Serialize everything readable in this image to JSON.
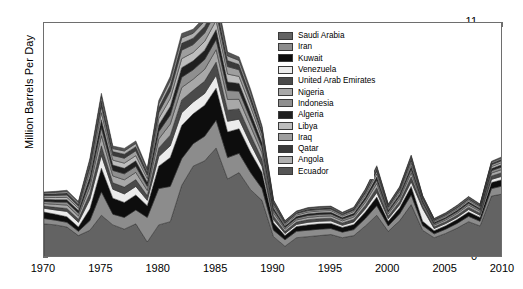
{
  "chart_data": {
    "type": "area",
    "stacked": true,
    "title": "",
    "subtitle": "",
    "xlabel": "",
    "ylabel": "Million Barrels Per Day",
    "xlim": [
      1970,
      2010
    ],
    "ylim": [
      0,
      11
    ],
    "ytick_labels": [
      "0",
      "1",
      "2",
      "3",
      "4",
      "5",
      "6",
      "7",
      "8",
      "9",
      "10",
      "11"
    ],
    "ytick_values": [
      0,
      1,
      2,
      3,
      4,
      5,
      6,
      7,
      8,
      9,
      10,
      11
    ],
    "xtick_labels": [
      "1970",
      "1975",
      "1980",
      "1985",
      "1990",
      "1995",
      "2000",
      "2005",
      "2010"
    ],
    "xtick_values": [
      1970,
      1975,
      1980,
      1985,
      1990,
      1995,
      2000,
      2005,
      2010
    ],
    "grid": false,
    "legend_position": "inside-top-center",
    "x": [
      1970,
      1971,
      1972,
      1973,
      1974,
      1975,
      1976,
      1977,
      1978,
      1979,
      1980,
      1981,
      1982,
      1983,
      1984,
      1985,
      1986,
      1987,
      1988,
      1989,
      1990,
      1991,
      1992,
      1993,
      1994,
      1995,
      1996,
      1997,
      1998,
      1999,
      2000,
      2001,
      2002,
      2003,
      2004,
      2005,
      2006,
      2007,
      2008,
      2009,
      2010
    ],
    "series": [
      {
        "name": "Saudi Arabia",
        "color": "#636363",
        "values": [
          1.6,
          1.55,
          1.45,
          1.05,
          1.3,
          2.0,
          1.55,
          1.35,
          1.6,
          0.75,
          1.55,
          1.7,
          3.4,
          4.3,
          4.55,
          5.15,
          3.7,
          4.0,
          3.2,
          2.7,
          1.0,
          0.55,
          0.95,
          1.0,
          1.05,
          1.1,
          0.95,
          1.05,
          1.5,
          2.0,
          1.25,
          1.75,
          2.5,
          1.3,
          0.95,
          1.15,
          1.4,
          1.7,
          1.5,
          2.9,
          3.0
        ]
      },
      {
        "name": "Iran",
        "color": "#8c8c8c",
        "values": [
          0.25,
          0.22,
          0.22,
          0.2,
          0.45,
          1.1,
          0.5,
          0.55,
          0.65,
          1.15,
          1.7,
          1.65,
          1.25,
          1.05,
          1.15,
          1.3,
          1.0,
          0.9,
          0.8,
          0.55,
          0.3,
          0.3,
          0.3,
          0.3,
          0.3,
          0.28,
          0.26,
          0.28,
          0.35,
          0.45,
          0.25,
          0.32,
          0.45,
          0.22,
          0.18,
          0.2,
          0.22,
          0.25,
          0.22,
          0.35,
          0.38
        ]
      },
      {
        "name": "Kuwait",
        "color": "#0d0d0d",
        "values": [
          0.3,
          0.28,
          0.26,
          0.2,
          0.55,
          1.1,
          0.75,
          0.7,
          0.7,
          0.55,
          1.05,
          1.35,
          1.55,
          1.4,
          1.45,
          1.5,
          1.2,
          1.15,
          0.95,
          0.75,
          0.35,
          0.2,
          0.22,
          0.25,
          0.25,
          0.24,
          0.22,
          0.24,
          0.3,
          0.4,
          0.22,
          0.28,
          0.4,
          0.2,
          0.15,
          0.16,
          0.18,
          0.2,
          0.18,
          0.28,
          0.3
        ]
      },
      {
        "name": "Venezuela",
        "color": "#ececec",
        "values": [
          0.18,
          0.2,
          0.25,
          0.22,
          0.45,
          0.6,
          0.42,
          0.4,
          0.4,
          0.25,
          0.45,
          0.55,
          0.6,
          0.55,
          0.55,
          0.6,
          0.5,
          0.45,
          0.4,
          0.3,
          0.15,
          0.1,
          0.1,
          0.12,
          0.12,
          0.12,
          0.1,
          0.12,
          0.15,
          0.22,
          0.12,
          0.15,
          0.22,
          0.6,
          0.1,
          0.1,
          0.1,
          0.12,
          0.1,
          0.15,
          0.16
        ]
      },
      {
        "name": "United Arab Emirates",
        "color": "#4a4a4a",
        "values": [
          0.1,
          0.12,
          0.14,
          0.14,
          0.28,
          0.45,
          0.3,
          0.32,
          0.32,
          0.22,
          0.4,
          0.5,
          0.6,
          0.55,
          0.58,
          0.62,
          0.52,
          0.48,
          0.42,
          0.32,
          0.16,
          0.1,
          0.11,
          0.12,
          0.12,
          0.12,
          0.11,
          0.12,
          0.16,
          0.22,
          0.12,
          0.15,
          0.22,
          0.11,
          0.08,
          0.09,
          0.1,
          0.11,
          0.1,
          0.16,
          0.17
        ]
      },
      {
        "name": "Nigeria",
        "color": "#a8a8a8",
        "values": [
          0.12,
          0.14,
          0.16,
          0.16,
          0.3,
          0.48,
          0.32,
          0.34,
          0.34,
          0.24,
          0.42,
          0.52,
          0.58,
          0.52,
          0.55,
          0.58,
          0.5,
          0.45,
          0.4,
          0.3,
          0.15,
          0.1,
          0.1,
          0.11,
          0.11,
          0.11,
          0.1,
          0.11,
          0.15,
          0.2,
          0.11,
          0.14,
          0.2,
          0.1,
          0.08,
          0.08,
          0.09,
          0.1,
          0.09,
          0.14,
          0.15
        ]
      },
      {
        "name": "Indonesia",
        "color": "#8f8f8f",
        "values": [
          0.1,
          0.11,
          0.13,
          0.13,
          0.25,
          0.38,
          0.26,
          0.28,
          0.28,
          0.2,
          0.34,
          0.42,
          0.48,
          0.44,
          0.46,
          0.48,
          0.42,
          0.38,
          0.33,
          0.25,
          0.12,
          0.08,
          0.08,
          0.09,
          0.09,
          0.09,
          0.08,
          0.09,
          0.12,
          0.16,
          0.09,
          0.11,
          0.16,
          0.08,
          0.06,
          0.07,
          0.07,
          0.08,
          0.07,
          0.11,
          0.12
        ]
      },
      {
        "name": "Algeria",
        "color": "#1f1f1f",
        "values": [
          0.1,
          0.11,
          0.12,
          0.12,
          0.24,
          0.36,
          0.25,
          0.26,
          0.26,
          0.19,
          0.32,
          0.4,
          0.45,
          0.42,
          0.44,
          0.46,
          0.4,
          0.36,
          0.31,
          0.23,
          0.11,
          0.07,
          0.08,
          0.08,
          0.08,
          0.08,
          0.07,
          0.08,
          0.11,
          0.15,
          0.08,
          0.1,
          0.15,
          0.07,
          0.06,
          0.06,
          0.07,
          0.07,
          0.06,
          0.1,
          0.11
        ]
      },
      {
        "name": "Libya",
        "color": "#bdbdbd",
        "values": [
          0.09,
          0.1,
          0.11,
          0.11,
          0.22,
          0.33,
          0.23,
          0.24,
          0.24,
          0.17,
          0.3,
          0.37,
          0.42,
          0.39,
          0.41,
          0.43,
          0.37,
          0.33,
          0.29,
          0.21,
          0.1,
          0.07,
          0.07,
          0.08,
          0.08,
          0.08,
          0.07,
          0.08,
          0.1,
          0.14,
          0.08,
          0.1,
          0.14,
          0.07,
          0.05,
          0.06,
          0.06,
          0.07,
          0.06,
          0.09,
          0.1
        ]
      },
      {
        "name": "Iraq",
        "color": "#9e9e9e",
        "values": [
          0.09,
          0.1,
          0.11,
          0.1,
          0.21,
          0.31,
          0.22,
          0.23,
          0.23,
          0.16,
          0.28,
          0.35,
          0.4,
          0.37,
          0.39,
          0.41,
          0.35,
          0.31,
          0.27,
          0.2,
          0.1,
          0.06,
          0.07,
          0.07,
          0.07,
          0.07,
          0.06,
          0.07,
          0.1,
          0.13,
          0.07,
          0.09,
          0.13,
          0.06,
          0.05,
          0.05,
          0.06,
          0.06,
          0.05,
          0.09,
          0.09
        ]
      },
      {
        "name": "Qatar",
        "color": "#3a3a3a",
        "values": [
          0.07,
          0.08,
          0.09,
          0.09,
          0.17,
          0.25,
          0.18,
          0.19,
          0.19,
          0.13,
          0.23,
          0.28,
          0.32,
          0.3,
          0.31,
          0.33,
          0.28,
          0.25,
          0.22,
          0.16,
          0.08,
          0.05,
          0.05,
          0.06,
          0.06,
          0.06,
          0.05,
          0.06,
          0.08,
          0.1,
          0.06,
          0.07,
          0.1,
          0.05,
          0.04,
          0.04,
          0.05,
          0.05,
          0.04,
          0.07,
          0.07
        ]
      },
      {
        "name": "Angola",
        "color": "#b0b0b0",
        "values": [
          0.05,
          0.06,
          0.07,
          0.07,
          0.13,
          0.19,
          0.14,
          0.15,
          0.15,
          0.1,
          0.18,
          0.22,
          0.25,
          0.23,
          0.24,
          0.25,
          0.22,
          0.19,
          0.17,
          0.12,
          0.06,
          0.04,
          0.04,
          0.04,
          0.04,
          0.04,
          0.04,
          0.04,
          0.06,
          0.08,
          0.04,
          0.05,
          0.08,
          0.04,
          0.03,
          0.03,
          0.04,
          0.04,
          0.03,
          0.05,
          0.06
        ]
      },
      {
        "name": "Ecuador",
        "color": "#555555",
        "values": [
          0.04,
          0.05,
          0.06,
          0.06,
          0.11,
          0.16,
          0.12,
          0.12,
          0.12,
          0.09,
          0.15,
          0.18,
          0.21,
          0.19,
          0.2,
          0.21,
          0.18,
          0.16,
          0.14,
          0.1,
          0.05,
          0.03,
          0.03,
          0.04,
          0.04,
          0.04,
          0.03,
          0.04,
          0.05,
          0.07,
          0.04,
          0.04,
          0.07,
          0.03,
          0.02,
          0.03,
          0.03,
          0.03,
          0.03,
          0.04,
          0.05
        ]
      }
    ],
    "legend_entries": [
      "Saudi Arabia",
      "Iran",
      "Kuwait",
      "Venezuela",
      "United Arab Emirates",
      "Nigeria",
      "Indonesia",
      "Algeria",
      "Libya",
      "Iraq",
      "Qatar",
      "Angola",
      "Ecuador"
    ]
  }
}
